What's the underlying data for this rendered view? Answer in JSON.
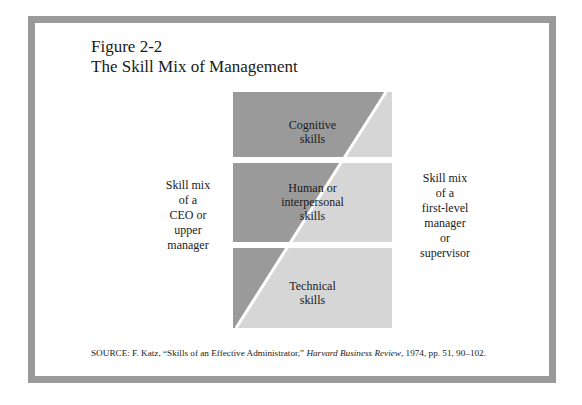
{
  "figure": {
    "number": "Figure 2-2",
    "title": "The Skill Mix of Management"
  },
  "diagram": {
    "colors": {
      "dark": "#9a9a9a",
      "light": "#d6d6d6",
      "gap": "#ffffff",
      "frame": "#9a9a9a"
    },
    "bands": [
      {
        "label_line1": "Cognitive",
        "label_line2": "skills",
        "label_line3": ""
      },
      {
        "label_line1": "Human or",
        "label_line2": "interpersonal",
        "label_line3": "skills"
      },
      {
        "label_line1": "Technical",
        "label_line2": "skills",
        "label_line3": ""
      }
    ],
    "left_label": [
      "Skill mix",
      "of a",
      "CEO or",
      "upper",
      "manager"
    ],
    "right_label": [
      "Skill mix",
      "of a",
      "first-level",
      "manager",
      "or",
      "supervisor"
    ]
  },
  "source": {
    "prefix": "SOURCE: F. Katz, “Skills of an Effective Administrator,” ",
    "journal": "Harvard Business Review",
    "suffix": ", 1974, pp. 51, 90–102."
  }
}
